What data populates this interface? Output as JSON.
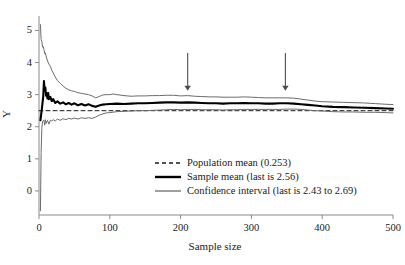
{
  "chart_data": {
    "type": "line",
    "title": "",
    "xlabel": "Sample size",
    "ylabel": "Y",
    "xlim": [
      0,
      500
    ],
    "ylim": [
      -0.75,
      5.45
    ],
    "grid": false,
    "legend_position": "center",
    "xticks": [
      0,
      100,
      200,
      300,
      400,
      500
    ],
    "xtick_labels": [
      "0",
      "100",
      "200",
      "300",
      "400",
      "500"
    ],
    "yticks": [
      0,
      1,
      2,
      3,
      4,
      5
    ],
    "ytick_labels": [
      "0",
      "1",
      "2",
      "3",
      "4",
      "5"
    ],
    "series": [
      {
        "name": "Population mean (0.253)",
        "style": "dashed",
        "color": "#1a1a1a",
        "width": 1,
        "constant_value": 2.5,
        "x": [
          0,
          500
        ],
        "values": [
          2.5,
          2.5
        ]
      },
      {
        "name": "Sample mean (last is 2.56)",
        "style": "solid",
        "color": "#000000",
        "width": 2.1,
        "x": [
          2,
          4,
          6,
          7,
          8,
          9,
          10,
          11,
          12,
          13,
          14,
          16,
          18,
          20,
          23,
          26,
          30,
          34,
          38,
          42,
          46,
          50,
          55,
          60,
          65,
          70,
          75,
          80,
          85,
          90,
          95,
          100,
          110,
          120,
          130,
          140,
          150,
          160,
          170,
          180,
          190,
          200,
          210,
          220,
          230,
          240,
          250,
          260,
          270,
          280,
          290,
          300,
          310,
          320,
          330,
          340,
          350,
          360,
          370,
          380,
          390,
          400,
          415,
          430,
          445,
          460,
          475,
          490,
          500
        ],
        "values": [
          2.2,
          2.55,
          2.95,
          3.42,
          3.12,
          3.22,
          2.97,
          3.05,
          2.88,
          3.05,
          2.86,
          2.93,
          2.8,
          2.86,
          2.74,
          2.79,
          2.72,
          2.76,
          2.7,
          2.74,
          2.69,
          2.73,
          2.67,
          2.71,
          2.66,
          2.7,
          2.65,
          2.62,
          2.66,
          2.69,
          2.7,
          2.71,
          2.72,
          2.71,
          2.72,
          2.73,
          2.73,
          2.74,
          2.75,
          2.76,
          2.76,
          2.75,
          2.76,
          2.75,
          2.74,
          2.73,
          2.73,
          2.72,
          2.73,
          2.73,
          2.74,
          2.73,
          2.73,
          2.72,
          2.72,
          2.73,
          2.73,
          2.72,
          2.7,
          2.68,
          2.66,
          2.64,
          2.62,
          2.61,
          2.6,
          2.59,
          2.58,
          2.57,
          2.56
        ]
      },
      {
        "name": "Confidence interval upper (last is 2.69)",
        "style": "solid",
        "color": "#6b6b6b",
        "width": 1,
        "x": [
          2,
          3,
          4,
          5,
          6,
          7,
          8,
          9,
          10,
          12,
          14,
          16,
          18,
          20,
          23,
          26,
          30,
          34,
          38,
          42,
          46,
          50,
          55,
          60,
          65,
          70,
          75,
          80,
          85,
          90,
          95,
          100,
          105,
          110,
          120,
          130,
          140,
          150,
          160,
          170,
          180,
          190,
          200,
          210,
          220,
          230,
          240,
          250,
          260,
          270,
          280,
          290,
          300,
          310,
          320,
          330,
          340,
          350,
          360,
          370,
          380,
          390,
          400,
          415,
          430,
          445,
          460,
          475,
          490,
          500
        ],
        "values": [
          5.18,
          4.72,
          4.66,
          4.48,
          4.5,
          4.4,
          4.28,
          4.3,
          4.2,
          4.05,
          3.95,
          3.88,
          3.76,
          3.68,
          3.55,
          3.44,
          3.35,
          3.27,
          3.2,
          3.15,
          3.12,
          3.1,
          3.06,
          3.04,
          3.02,
          3.0,
          2.96,
          2.9,
          2.94,
          2.99,
          3.0,
          3.0,
          3.02,
          3.0,
          2.97,
          2.95,
          2.96,
          2.96,
          2.97,
          2.97,
          2.98,
          2.98,
          2.96,
          2.97,
          2.95,
          2.94,
          2.93,
          2.93,
          2.92,
          2.92,
          2.92,
          2.93,
          2.92,
          2.91,
          2.9,
          2.9,
          2.9,
          2.9,
          2.89,
          2.86,
          2.83,
          2.8,
          2.78,
          2.77,
          2.76,
          2.75,
          2.74,
          2.72,
          2.7,
          2.69
        ]
      },
      {
        "name": "Confidence interval lower (last is 2.43)",
        "style": "solid",
        "color": "#6b6b6b",
        "width": 1,
        "x": [
          2,
          3,
          4,
          5,
          6,
          7,
          8,
          9,
          10,
          12,
          14,
          16,
          18,
          20,
          23,
          26,
          30,
          34,
          38,
          42,
          46,
          50,
          55,
          60,
          65,
          70,
          75,
          80,
          85,
          90,
          95,
          100,
          110,
          120,
          130,
          140,
          150,
          160,
          170,
          180,
          190,
          200,
          210,
          220,
          230,
          240,
          250,
          260,
          270,
          280,
          290,
          300,
          310,
          320,
          330,
          340,
          350,
          360,
          370,
          380,
          390,
          400,
          415,
          430,
          445,
          460,
          475,
          490,
          500
        ],
        "values": [
          -0.62,
          1.2,
          1.95,
          2.16,
          2.2,
          2.2,
          2.05,
          2.22,
          2.1,
          2.2,
          2.08,
          2.2,
          2.18,
          2.22,
          2.18,
          2.24,
          2.2,
          2.25,
          2.22,
          2.26,
          2.24,
          2.27,
          2.24,
          2.28,
          2.26,
          2.28,
          2.26,
          2.3,
          2.36,
          2.4,
          2.43,
          2.44,
          2.47,
          2.48,
          2.49,
          2.5,
          2.5,
          2.51,
          2.52,
          2.53,
          2.54,
          2.53,
          2.54,
          2.54,
          2.53,
          2.53,
          2.53,
          2.52,
          2.53,
          2.53,
          2.54,
          2.54,
          2.54,
          2.54,
          2.54,
          2.54,
          2.55,
          2.55,
          2.54,
          2.52,
          2.5,
          2.49,
          2.47,
          2.46,
          2.46,
          2.45,
          2.45,
          2.44,
          2.43
        ]
      }
    ],
    "annotations": [
      {
        "name": "arrow-marker-1",
        "x": 210,
        "y_top": 4.3,
        "y_tip": 3.12,
        "direction": "down",
        "color": "#4d4d4d"
      },
      {
        "name": "arrow-marker-2",
        "x": 348,
        "y_top": 4.3,
        "y_tip": 3.12,
        "direction": "down",
        "color": "#4d4d4d"
      }
    ]
  },
  "legend": {
    "entries": [
      {
        "label": "Population mean (0.253)",
        "swatch": "dashed-line-swatch"
      },
      {
        "label": "Sample mean (last is 2.56)",
        "swatch": "thick-line-swatch"
      },
      {
        "label": "Confidence interval (last is 2.43 to 2.69)",
        "swatch": "thin-line-swatch"
      }
    ]
  },
  "axes": {
    "x_title": "Sample size",
    "y_title": "Y",
    "xtick_labels": [
      "0",
      "100",
      "200",
      "300",
      "400",
      "500"
    ],
    "ytick_labels": [
      "0",
      "1",
      "2",
      "3",
      "4",
      "5"
    ]
  },
  "colors": {
    "axis": "#8a8a8a",
    "sample_mean": "#000000",
    "confidence_interval": "#6b6b6b",
    "population_mean": "#1a1a1a",
    "arrow": "#4d4d4d",
    "text": "#1a1a1a",
    "background": "#ffffff"
  }
}
